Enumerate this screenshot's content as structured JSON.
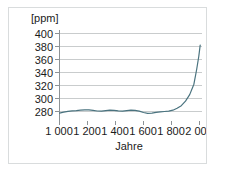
{
  "figure": {
    "frame_color": "#d9dcdd",
    "background": "#ffffff"
  },
  "caption": {
    "text": ""
  },
  "chart_data": {
    "type": "line",
    "title": "",
    "subtitle": "",
    "xlabel": "Jahre",
    "ylabel": "",
    "y_unit_label": "[ppm]",
    "xlim": [
      950,
      2030
    ],
    "ylim": [
      270,
      405
    ],
    "grid": "horizontal",
    "legend_position": "none",
    "line_color": "#4a737f",
    "line_width": 1.2,
    "x_ticks": [
      1000,
      1200,
      1400,
      1600,
      1800,
      2000
    ],
    "x_tick_labels": [
      "1 000",
      "1 200",
      "1 400",
      "1 600",
      "1 800",
      "2 000"
    ],
    "y_ticks": [
      280,
      300,
      320,
      340,
      360,
      380,
      400
    ],
    "y_tick_labels": [
      "280",
      "300",
      "320",
      "340",
      "360",
      "380",
      "400"
    ],
    "series": [
      {
        "name": "CO2-Konzentration",
        "x": [
          1000,
          1030,
          1060,
          1090,
          1120,
          1150,
          1180,
          1210,
          1240,
          1270,
          1300,
          1330,
          1360,
          1390,
          1420,
          1450,
          1480,
          1510,
          1540,
          1570,
          1600,
          1630,
          1660,
          1690,
          1720,
          1750,
          1780,
          1810,
          1840,
          1870,
          1900,
          1930,
          1960,
          1980,
          1995,
          2005
        ],
        "y": [
          277.5,
          279.0,
          280.3,
          281.0,
          281.4,
          282.0,
          282.6,
          282.4,
          281.6,
          280.8,
          280.6,
          281.3,
          282.0,
          281.6,
          280.9,
          280.7,
          281.4,
          282.1,
          281.7,
          280.6,
          278.5,
          277.2,
          277.6,
          278.6,
          279.4,
          280.0,
          280.6,
          282.0,
          285.0,
          289.0,
          296.0,
          306.0,
          322.0,
          345.0,
          365.0,
          382.0
        ]
      }
    ],
    "annotations": []
  }
}
